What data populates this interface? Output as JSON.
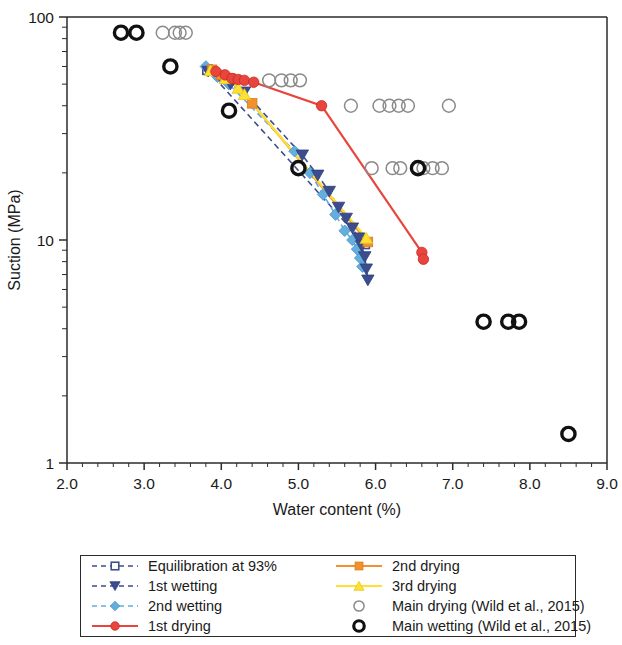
{
  "chart_data": {
    "type": "scatter",
    "title": "",
    "xlabel": "Water content (%)",
    "ylabel": "Suction (MPa)",
    "xscale": "linear",
    "yscale": "log",
    "xlim": [
      2.0,
      9.0
    ],
    "ylim": [
      1,
      100
    ],
    "xticks": [
      "2.0",
      "3.0",
      "4.0",
      "5.0",
      "6.0",
      "7.0",
      "8.0",
      "9.0"
    ],
    "xtick_values": [
      2.0,
      3.0,
      4.0,
      5.0,
      6.0,
      7.0,
      8.0,
      9.0
    ],
    "x_minor_step": 0.2,
    "yticks": [
      "1",
      "10",
      "100"
    ],
    "ytick_values": [
      1,
      10,
      100
    ],
    "grid": false,
    "legend_position": "below-plot",
    "series": [
      {
        "name": "Equilibration at 93%",
        "marker": "open-square",
        "color": "#3F4E8C",
        "line": "dashed",
        "points": [
          {
            "x": 3.82,
            "y": 58.0
          },
          {
            "x": 5.86,
            "y": 9.6
          }
        ]
      },
      {
        "name": "1st wetting",
        "marker": "triangle-down",
        "color": "#3B4D8F",
        "line": "dashed",
        "points": [
          {
            "x": 3.83,
            "y": 57.0
          },
          {
            "x": 4.0,
            "y": 53.0
          },
          {
            "x": 4.12,
            "y": 50.0
          },
          {
            "x": 4.3,
            "y": 46.0
          },
          {
            "x": 5.05,
            "y": 24.0
          },
          {
            "x": 5.25,
            "y": 19.5
          },
          {
            "x": 5.4,
            "y": 16.5
          },
          {
            "x": 5.52,
            "y": 14.0
          },
          {
            "x": 5.62,
            "y": 12.5
          },
          {
            "x": 5.7,
            "y": 11.3
          },
          {
            "x": 5.78,
            "y": 10.2
          },
          {
            "x": 5.82,
            "y": 9.4
          },
          {
            "x": 5.86,
            "y": 8.4
          },
          {
            "x": 5.88,
            "y": 7.4
          },
          {
            "x": 5.9,
            "y": 6.6
          }
        ]
      },
      {
        "name": "2nd wetting",
        "marker": "diamond",
        "color": "#63AEDC",
        "line": "dashed",
        "points": [
          {
            "x": 3.8,
            "y": 60.0
          },
          {
            "x": 3.95,
            "y": 54.0
          },
          {
            "x": 4.1,
            "y": 50.0
          },
          {
            "x": 4.95,
            "y": 25.0
          },
          {
            "x": 5.15,
            "y": 20.0
          },
          {
            "x": 5.32,
            "y": 16.0
          },
          {
            "x": 5.48,
            "y": 13.0
          },
          {
            "x": 5.6,
            "y": 11.0
          },
          {
            "x": 5.7,
            "y": 10.0
          },
          {
            "x": 5.76,
            "y": 9.1
          },
          {
            "x": 5.8,
            "y": 8.3
          },
          {
            "x": 5.83,
            "y": 7.6
          }
        ]
      },
      {
        "name": "1st drying",
        "marker": "circle",
        "color": "#E8453C",
        "line": "solid",
        "points": [
          {
            "x": 3.93,
            "y": 57.0
          },
          {
            "x": 4.05,
            "y": 55.0
          },
          {
            "x": 4.14,
            "y": 53.0
          },
          {
            "x": 4.22,
            "y": 52.5
          },
          {
            "x": 4.3,
            "y": 52.0
          },
          {
            "x": 4.42,
            "y": 51.0
          },
          {
            "x": 5.3,
            "y": 40.0
          },
          {
            "x": 6.6,
            "y": 8.8
          },
          {
            "x": 6.62,
            "y": 8.2
          }
        ]
      },
      {
        "name": "2nd drying",
        "marker": "square",
        "color": "#F2912E",
        "line": "solid",
        "points": [
          {
            "x": 3.88,
            "y": 58.0
          },
          {
            "x": 4.0,
            "y": 55.0
          },
          {
            "x": 4.12,
            "y": 53.0
          },
          {
            "x": 4.4,
            "y": 41.0
          },
          {
            "x": 5.9,
            "y": 9.8
          }
        ]
      },
      {
        "name": "3rd drying",
        "marker": "triangle-up",
        "color": "#FFE033",
        "line": "solid",
        "points": [
          {
            "x": 3.86,
            "y": 57.5
          },
          {
            "x": 4.05,
            "y": 53.0
          },
          {
            "x": 4.22,
            "y": 48.0
          },
          {
            "x": 4.3,
            "y": 45.0
          },
          {
            "x": 5.88,
            "y": 10.2
          }
        ]
      },
      {
        "name": "Main drying (Wild et al., 2015)",
        "marker": "open-circle-thin",
        "color": "#8a8a8a",
        "line": "none",
        "points": [
          {
            "x": 3.24,
            "y": 85.0
          },
          {
            "x": 3.4,
            "y": 85.0
          },
          {
            "x": 3.46,
            "y": 85.0
          },
          {
            "x": 3.54,
            "y": 85.0
          },
          {
            "x": 4.62,
            "y": 52.0
          },
          {
            "x": 4.78,
            "y": 52.0
          },
          {
            "x": 4.9,
            "y": 52.0
          },
          {
            "x": 5.02,
            "y": 52.0
          },
          {
            "x": 5.68,
            "y": 40.0
          },
          {
            "x": 6.05,
            "y": 40.0
          },
          {
            "x": 6.18,
            "y": 40.0
          },
          {
            "x": 6.3,
            "y": 40.0
          },
          {
            "x": 6.42,
            "y": 40.0
          },
          {
            "x": 6.95,
            "y": 40.0
          },
          {
            "x": 5.95,
            "y": 21.0
          },
          {
            "x": 6.22,
            "y": 21.0
          },
          {
            "x": 6.32,
            "y": 21.0
          },
          {
            "x": 6.62,
            "y": 21.0
          },
          {
            "x": 6.74,
            "y": 21.0
          },
          {
            "x": 6.86,
            "y": 21.0
          }
        ]
      },
      {
        "name": "Main wetting (Wild et al., 2015)",
        "marker": "open-circle-thick",
        "color": "#111111",
        "line": "none",
        "points": [
          {
            "x": 2.7,
            "y": 85.0
          },
          {
            "x": 2.9,
            "y": 85.0
          },
          {
            "x": 3.34,
            "y": 60.0
          },
          {
            "x": 4.1,
            "y": 38.0
          },
          {
            "x": 5.0,
            "y": 21.0
          },
          {
            "x": 6.55,
            "y": 21.0
          },
          {
            "x": 7.4,
            "y": 4.3
          },
          {
            "x": 7.72,
            "y": 4.3
          },
          {
            "x": 7.86,
            "y": 4.3
          },
          {
            "x": 8.5,
            "y": 1.35
          }
        ]
      }
    ]
  },
  "legend": {
    "items": [
      {
        "label": "Equilibration at 93%",
        "marker": "open-square",
        "color": "#3F4E8C",
        "line": "dashed",
        "column": 1
      },
      {
        "label": "1st wetting",
        "marker": "triangle-down",
        "color": "#3B4D8F",
        "line": "dashed",
        "column": 1
      },
      {
        "label": "2nd wetting",
        "marker": "diamond",
        "color": "#63AEDC",
        "line": "dashed",
        "column": 1
      },
      {
        "label": "1st drying",
        "marker": "circle",
        "color": "#E8453C",
        "line": "solid",
        "column": 1
      },
      {
        "label": "2nd drying",
        "marker": "square",
        "color": "#F2912E",
        "line": "solid",
        "column": 2
      },
      {
        "label": "3rd drying",
        "marker": "triangle-up",
        "color": "#FFE033",
        "line": "solid",
        "column": 2
      },
      {
        "label": "Main drying (Wild et al., 2015)",
        "marker": "open-circle-thin",
        "color": "#8a8a8a",
        "line": "none",
        "column": 2
      },
      {
        "label": "Main wetting (Wild et al., 2015)",
        "marker": "open-circle-thick",
        "color": "#111111",
        "line": "none",
        "column": 2
      }
    ]
  }
}
